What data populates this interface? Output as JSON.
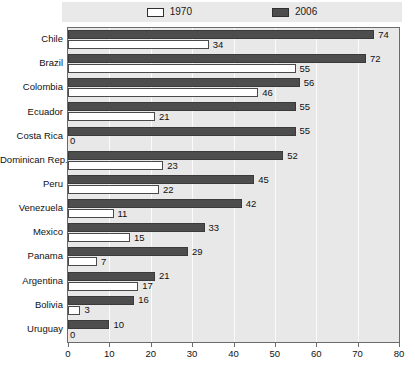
{
  "chart_data": {
    "type": "bar",
    "orientation": "horizontal",
    "title": "",
    "subtitle": "",
    "xlabel": "",
    "ylabel": "",
    "xlim": [
      0,
      80
    ],
    "xticks": [
      0,
      10,
      20,
      30,
      40,
      50,
      60,
      70,
      80
    ],
    "grid": true,
    "legend_position": "top",
    "categories": [
      "Chile",
      "Brazil",
      "Colombia",
      "Ecuador",
      "Costa Rica",
      "Dominican Rep.",
      "Peru",
      "Venezuela",
      "Mexico",
      "Panama",
      "Argentina",
      "Bolivia",
      "Uruguay"
    ],
    "series": [
      {
        "name": "2006",
        "color": "#4d4d4d",
        "values": [
          74,
          72,
          56,
          55,
          55,
          52,
          45,
          42,
          33,
          29,
          21,
          16,
          10
        ]
      },
      {
        "name": "1970",
        "color": "#ffffff",
        "values": [
          34,
          55,
          46,
          21,
          0,
          23,
          22,
          11,
          15,
          7,
          17,
          3,
          0
        ]
      }
    ]
  },
  "legend": {
    "entries": [
      {
        "label": "1970",
        "swatch": "open-square-swatch"
      },
      {
        "label": "2006",
        "swatch": "filled-square-swatch"
      }
    ]
  },
  "colors": {
    "plot_background": "#e8e8e8",
    "gridline": "#fbfbfb",
    "frame_border": "#6b6b6b",
    "bar_2006": "#4d4d4d",
    "bar_1970": "#ffffff",
    "legend_background": "#e9e9e9",
    "text": "#111111"
  }
}
